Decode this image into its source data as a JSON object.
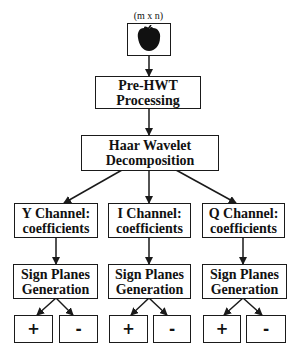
{
  "input": {
    "dimension_label": "(m x n)",
    "icon": "apple-image-icon"
  },
  "stages": {
    "pre_hwt": {
      "line1": "Pre-HWT",
      "line2": "Processing"
    },
    "haar": {
      "line1": "Haar Wavelet",
      "line2": "Decomposition"
    }
  },
  "channels": [
    {
      "name": "Y",
      "line1": "Y Channel:",
      "line2": "coefficients",
      "sign": {
        "line1": "Sign Planes",
        "line2": "Generation"
      },
      "outputs": [
        "+",
        "-"
      ]
    },
    {
      "name": "I",
      "line1": "I Channel:",
      "line2": "coefficients",
      "sign": {
        "line1": "Sign Planes",
        "line2": "Generation"
      },
      "outputs": [
        "+",
        "-"
      ]
    },
    {
      "name": "Q",
      "line1": "Q Channel:",
      "line2": "coefficients",
      "sign": {
        "line1": "Sign Planes",
        "line2": "Generation"
      },
      "outputs": [
        "+",
        "-"
      ]
    }
  ],
  "colors": {
    "stroke": "#1a1a1a",
    "background": "#ffffff"
  }
}
